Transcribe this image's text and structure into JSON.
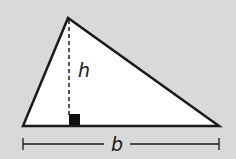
{
  "diagram": {
    "type": "triangle-area",
    "labels": {
      "height": "h",
      "base": "b"
    },
    "vertices": {
      "apex": [
        68,
        18
      ],
      "bottom_left": [
        23,
        126
      ],
      "bottom_right": [
        219,
        126
      ]
    },
    "colors": {
      "background": "#d9d9d9",
      "fill": "#ffffff",
      "stroke": "#1a1a1a"
    },
    "features": [
      "dashed height line",
      "right-angle marker",
      "base dimension line"
    ]
  }
}
